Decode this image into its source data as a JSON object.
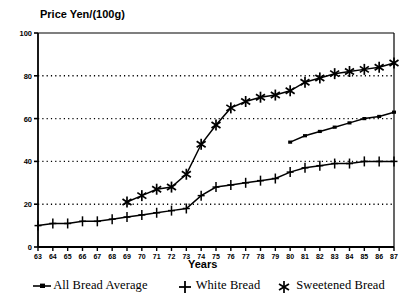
{
  "chart_data": {
    "type": "line",
    "title": "Price Yen/(100g)",
    "ylabel": "Price Yen/(100g)",
    "xlabel": "Years",
    "xlim": [
      63,
      87
    ],
    "ylim": [
      0,
      100
    ],
    "grid": true,
    "gridlines_y": [
      20,
      40,
      60,
      80
    ],
    "legend_position": "bottom",
    "x_tick_labels": [
      "63",
      "64",
      "65",
      "66",
      "67",
      "68",
      "69",
      "70",
      "71",
      "72",
      "73",
      "74",
      "75",
      "76",
      "77",
      "78",
      "79",
      "80",
      "81",
      "82",
      "83",
      "84",
      "85",
      "86",
      "87"
    ],
    "y_tick_labels": [
      "0",
      "20",
      "40",
      "60",
      "80",
      "100"
    ],
    "y_ticks": [
      0,
      20,
      40,
      60,
      80,
      100
    ],
    "series": [
      {
        "name": "All Bread Average",
        "marker": "dash",
        "x": [
          80,
          81,
          82,
          83,
          84,
          85,
          86,
          87
        ],
        "values": [
          49,
          52,
          54,
          56,
          58,
          60,
          61,
          63
        ]
      },
      {
        "name": "White Bread",
        "marker": "plus",
        "x": [
          63,
          64,
          65,
          66,
          67,
          68,
          69,
          70,
          71,
          72,
          73,
          74,
          75,
          76,
          77,
          78,
          79,
          80,
          81,
          82,
          83,
          84,
          85,
          86,
          87
        ],
        "values": [
          10,
          11,
          11,
          12,
          12,
          13,
          14,
          15,
          16,
          17,
          18,
          24,
          28,
          29,
          30,
          31,
          32,
          35,
          37,
          38,
          39,
          39,
          40,
          40,
          40
        ]
      },
      {
        "name": "Sweetened Bread",
        "marker": "asterisk",
        "x": [
          69,
          70,
          71,
          72,
          73,
          74,
          75,
          76,
          77,
          78,
          79,
          80,
          81,
          82,
          83,
          84,
          85,
          86,
          87
        ],
        "values": [
          21,
          24,
          27,
          28,
          34,
          48,
          57,
          65,
          68,
          70,
          71,
          73,
          77,
          79,
          81,
          82,
          83,
          84,
          86
        ]
      }
    ]
  },
  "legend": {
    "entries": [
      {
        "label": "All Bread Average",
        "marker": "dash-marker"
      },
      {
        "label": "White Bread",
        "marker": "plus-marker"
      },
      {
        "label": "Sweetened Bread",
        "marker": "asterisk-marker"
      }
    ]
  },
  "axes": {
    "y_title": "Price Yen/(100g)",
    "x_title": "Years"
  }
}
